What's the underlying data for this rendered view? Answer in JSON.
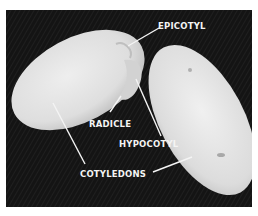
{
  "figure": {
    "background_color": "#141414",
    "seed_color": "#e6e6e6",
    "label_color": "#f4f4f4",
    "labels": [
      {
        "id": "epicotyl",
        "text": "EPICOTYL"
      },
      {
        "id": "radicle",
        "text": "RADICLE"
      },
      {
        "id": "hypocotyl",
        "text": "HYPOCOTYL"
      },
      {
        "id": "cotyledons",
        "text": "COTYLEDONS"
      }
    ]
  }
}
